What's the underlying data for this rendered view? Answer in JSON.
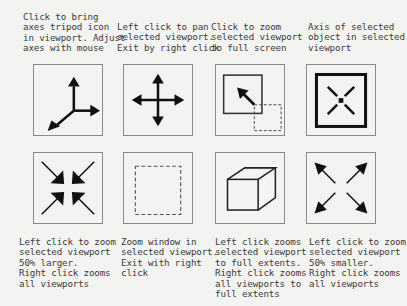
{
  "legend": {
    "row1": [
      {
        "id": "tripod",
        "icon": "axes-tripod-icon",
        "caption": "Click to bring\naxes tripod icon\nin viewport. Adjust\naxes with mouse"
      },
      {
        "id": "pan",
        "icon": "pan-arrows-icon",
        "caption": "Left click to pan\nselected viewport.\nExit by right click"
      },
      {
        "id": "full-screen",
        "icon": "zoom-full-screen-icon",
        "caption": "Click to zoom\nselected viewport\nto full screen"
      },
      {
        "id": "axis",
        "icon": "object-axis-icon",
        "caption": "Axis of selected\nobject in selected\nviewport"
      }
    ],
    "row2": [
      {
        "id": "zoom-in",
        "icon": "zoom-in-arrows-icon",
        "caption": "Left click to zoom\nselected viewport\n50% larger.\nRight click zooms\nall viewports"
      },
      {
        "id": "zoom-window",
        "icon": "zoom-window-icon",
        "caption": "Zoom window in\nselected viewport.\nExit with right\nclick"
      },
      {
        "id": "zoom-extents",
        "icon": "zoom-extents-cube-icon",
        "caption": "Left click zooms\nselected viewport\nto full extents.\nRight click zooms\nall viewports to\nfull extents"
      },
      {
        "id": "zoom-out",
        "icon": "zoom-out-arrows-icon",
        "caption": "Left click to zoom\nselected viewport\n50% smaller.\nRight click zooms\nall viewports"
      }
    ]
  },
  "colors": {
    "background": "#f3f3f1",
    "icon": "#111111",
    "frame": "#8a8a8a",
    "text": "#3a3a3a"
  }
}
